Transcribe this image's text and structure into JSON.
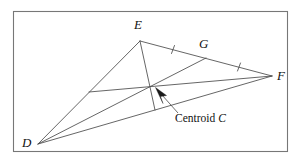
{
  "figure": {
    "frame": {
      "x": 13,
      "y": 11,
      "width": 275,
      "height": 141,
      "stroke_color": "#777777"
    },
    "line_color": "#4a4a4a",
    "text_color": "#111111",
    "background_color": "#ffffff"
  },
  "vertices": [
    {
      "id": "D",
      "label": "D",
      "x": 38,
      "y": 144
    },
    {
      "id": "E",
      "label": "E",
      "x": 140,
      "y": 41
    },
    {
      "id": "F",
      "label": "F",
      "x": 272,
      "y": 76
    }
  ],
  "points": [
    {
      "id": "G",
      "label": "G",
      "x": 206,
      "y": 58,
      "role": "midpoint-of-EF"
    },
    {
      "id": "M_DE",
      "label": "",
      "x": 89,
      "y": 92,
      "role": "midpoint-of-DE"
    },
    {
      "id": "M_DF",
      "label": "",
      "x": 155,
      "y": 110,
      "role": "midpoint-of-DF"
    },
    {
      "id": "C",
      "label": "C",
      "x": 152,
      "y": 88,
      "role": "centroid"
    }
  ],
  "segments": [
    {
      "name": "side-DE",
      "from": "D",
      "to": "E"
    },
    {
      "name": "side-EF",
      "from": "E",
      "to": "F"
    },
    {
      "name": "side-DF",
      "from": "D",
      "to": "F"
    },
    {
      "name": "median-D-to-G",
      "from": "D",
      "to": "G"
    },
    {
      "name": "median-E-to-MDF",
      "from": "E",
      "to": "M_DF"
    },
    {
      "name": "median-F-to-MDE",
      "from": "F",
      "to": "M_DE"
    }
  ],
  "tick_marks": [
    {
      "name": "tick-EG",
      "on_segment": "EG",
      "x": 173,
      "y": 49.5
    },
    {
      "name": "tick-GF",
      "on_segment": "GF",
      "x": 239,
      "y": 67
    }
  ],
  "annotation": {
    "text_prefix": "Centroid ",
    "variable": "C",
    "full_text": "Centroid C",
    "leader_from": {
      "x": 176,
      "y": 112
    },
    "arrow_tip": {
      "x": 156,
      "y": 89
    }
  }
}
